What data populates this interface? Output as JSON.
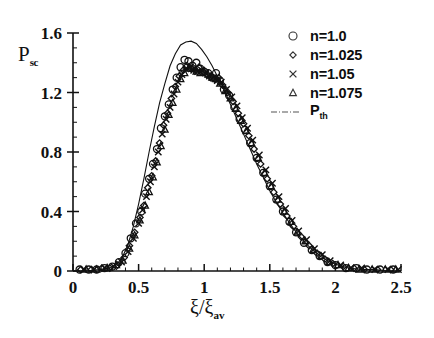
{
  "chart_data": {
    "type": "scatter",
    "title": "",
    "xlabel": "ξ/ξav",
    "xlabel_main": "ξ/ξ",
    "xlabel_sub": "av",
    "ylabel_main": "P",
    "ylabel_sub": "sc",
    "xlim": [
      0,
      2.5
    ],
    "ylim": [
      0,
      1.6
    ],
    "xticks": [
      0,
      0.5,
      1,
      1.5,
      2,
      2.5
    ],
    "xticklabels": [
      "0",
      "0.5",
      "1",
      "1.5",
      "2",
      "2.5"
    ],
    "yticks": [
      0,
      0.4,
      0.8,
      1.2,
      1.6
    ],
    "yticklabels": [
      "0",
      "0.4",
      "0.8",
      "1.2",
      "1.6"
    ],
    "minor_ticks": true,
    "grid": false,
    "legend_position": "top-right",
    "legend": [
      {
        "label": "n=1.0",
        "marker": "circle"
      },
      {
        "label": "n=1.025",
        "marker": "diamond"
      },
      {
        "label": "n=1.05",
        "marker": "cross"
      },
      {
        "label": "n=1.075",
        "marker": "triangle"
      },
      {
        "label": "Pth",
        "label_main": "P",
        "label_sub": "th",
        "marker": "dashdot-line"
      }
    ],
    "series": [
      {
        "name": "n=1.0",
        "marker": "circle",
        "x": [
          0.05,
          0.12,
          0.18,
          0.24,
          0.3,
          0.35,
          0.4,
          0.44,
          0.48,
          0.52,
          0.55,
          0.58,
          0.61,
          0.64,
          0.67,
          0.7,
          0.73,
          0.76,
          0.79,
          0.82,
          0.85,
          0.88,
          0.91,
          0.94,
          0.97,
          1.0,
          1.03,
          1.06,
          1.09,
          1.12,
          1.15,
          1.19,
          1.23,
          1.27,
          1.31,
          1.35,
          1.4,
          1.45,
          1.5,
          1.55,
          1.6,
          1.65,
          1.7,
          1.76,
          1.82,
          1.88,
          1.94,
          2.0,
          2.08,
          2.16,
          2.24,
          2.34,
          2.44
        ],
        "y": [
          0.01,
          0.01,
          0.01,
          0.02,
          0.03,
          0.06,
          0.12,
          0.22,
          0.32,
          0.4,
          0.52,
          0.62,
          0.72,
          0.82,
          0.96,
          1.04,
          1.12,
          1.22,
          1.3,
          1.37,
          1.42,
          1.41,
          1.38,
          1.4,
          1.36,
          1.34,
          1.33,
          1.3,
          1.33,
          1.28,
          1.22,
          1.18,
          1.1,
          1.02,
          0.95,
          0.86,
          0.76,
          0.66,
          0.57,
          0.48,
          0.4,
          0.33,
          0.26,
          0.19,
          0.14,
          0.1,
          0.06,
          0.04,
          0.02,
          0.02,
          0.01,
          0.01,
          0.01
        ]
      },
      {
        "name": "n=1.025",
        "marker": "diamond",
        "x": [
          0.06,
          0.14,
          0.22,
          0.28,
          0.34,
          0.39,
          0.43,
          0.47,
          0.51,
          0.54,
          0.57,
          0.6,
          0.63,
          0.66,
          0.69,
          0.72,
          0.75,
          0.78,
          0.81,
          0.84,
          0.87,
          0.9,
          0.93,
          0.96,
          0.99,
          1.02,
          1.05,
          1.08,
          1.11,
          1.14,
          1.18,
          1.22,
          1.26,
          1.3,
          1.34,
          1.38,
          1.43,
          1.48,
          1.53,
          1.58,
          1.63,
          1.68,
          1.74,
          1.8,
          1.86,
          1.92,
          1.98,
          2.06,
          2.14,
          2.22,
          2.32,
          2.42
        ],
        "y": [
          0.01,
          0.01,
          0.02,
          0.02,
          0.04,
          0.09,
          0.17,
          0.26,
          0.36,
          0.44,
          0.56,
          0.64,
          0.74,
          0.86,
          0.98,
          1.06,
          1.16,
          1.24,
          1.31,
          1.35,
          1.38,
          1.36,
          1.35,
          1.37,
          1.34,
          1.32,
          1.31,
          1.29,
          1.3,
          1.25,
          1.2,
          1.14,
          1.06,
          0.99,
          0.91,
          0.82,
          0.72,
          0.62,
          0.53,
          0.45,
          0.37,
          0.3,
          0.23,
          0.17,
          0.12,
          0.08,
          0.05,
          0.03,
          0.02,
          0.01,
          0.01,
          0.01
        ]
      },
      {
        "name": "n=1.05",
        "marker": "cross",
        "x": [
          0.08,
          0.16,
          0.24,
          0.31,
          0.37,
          0.42,
          0.46,
          0.5,
          0.53,
          0.56,
          0.59,
          0.62,
          0.65,
          0.68,
          0.71,
          0.74,
          0.77,
          0.8,
          0.83,
          0.86,
          0.89,
          0.92,
          0.95,
          0.98,
          1.01,
          1.04,
          1.07,
          1.1,
          1.13,
          1.17,
          1.21,
          1.25,
          1.29,
          1.33,
          1.37,
          1.42,
          1.47,
          1.52,
          1.57,
          1.62,
          1.67,
          1.72,
          1.78,
          1.84,
          1.9,
          1.96,
          2.04,
          2.12,
          2.2,
          2.3,
          2.4,
          2.48
        ],
        "y": [
          0.01,
          0.01,
          0.02,
          0.03,
          0.06,
          0.13,
          0.22,
          0.32,
          0.41,
          0.5,
          0.6,
          0.7,
          0.8,
          0.92,
          1.02,
          1.1,
          1.19,
          1.27,
          1.32,
          1.36,
          1.37,
          1.35,
          1.34,
          1.35,
          1.33,
          1.31,
          1.3,
          1.28,
          1.27,
          1.22,
          1.17,
          1.11,
          1.03,
          0.96,
          0.88,
          0.78,
          0.68,
          0.59,
          0.5,
          0.42,
          0.34,
          0.27,
          0.21,
          0.15,
          0.11,
          0.07,
          0.04,
          0.02,
          0.02,
          0.01,
          0.01,
          0.01
        ]
      },
      {
        "name": "n=1.075",
        "marker": "triangle",
        "x": [
          0.1,
          0.18,
          0.26,
          0.33,
          0.38,
          0.43,
          0.47,
          0.51,
          0.55,
          0.58,
          0.61,
          0.64,
          0.67,
          0.7,
          0.73,
          0.76,
          0.79,
          0.82,
          0.85,
          0.88,
          0.91,
          0.94,
          0.97,
          1.0,
          1.03,
          1.06,
          1.09,
          1.12,
          1.16,
          1.2,
          1.24,
          1.28,
          1.32,
          1.36,
          1.41,
          1.46,
          1.51,
          1.56,
          1.61,
          1.66,
          1.71,
          1.77,
          1.83,
          1.89,
          1.95,
          2.02,
          2.1,
          2.18,
          2.28,
          2.38,
          2.46
        ],
        "y": [
          0.01,
          0.01,
          0.02,
          0.04,
          0.07,
          0.15,
          0.24,
          0.34,
          0.44,
          0.53,
          0.63,
          0.73,
          0.84,
          0.95,
          1.05,
          1.13,
          1.22,
          1.29,
          1.33,
          1.36,
          1.36,
          1.34,
          1.33,
          1.34,
          1.32,
          1.3,
          1.29,
          1.26,
          1.21,
          1.16,
          1.09,
          1.01,
          0.94,
          0.86,
          0.76,
          0.66,
          0.57,
          0.48,
          0.4,
          0.33,
          0.26,
          0.2,
          0.14,
          0.1,
          0.06,
          0.04,
          0.02,
          0.01,
          0.01,
          0.01,
          0.01
        ]
      }
    ],
    "theory_curve": {
      "name": "Pth",
      "style": "solid-thin",
      "x": [
        0.0,
        0.1,
        0.2,
        0.28,
        0.34,
        0.38,
        0.42,
        0.46,
        0.5,
        0.54,
        0.58,
        0.62,
        0.66,
        0.7,
        0.74,
        0.78,
        0.82,
        0.86,
        0.9,
        0.94,
        0.98,
        1.02,
        1.06,
        1.1,
        1.14,
        1.18,
        1.22,
        1.26,
        1.3,
        1.35,
        1.4,
        1.45,
        1.5,
        1.55,
        1.6,
        1.66,
        1.72,
        1.78,
        1.84,
        1.9,
        1.96,
        2.02,
        2.1,
        2.2,
        2.3,
        2.4,
        2.5
      ],
      "y": [
        0.0,
        0.0,
        0.01,
        0.02,
        0.05,
        0.1,
        0.18,
        0.3,
        0.45,
        0.62,
        0.8,
        0.97,
        1.13,
        1.26,
        1.38,
        1.46,
        1.52,
        1.54,
        1.545,
        1.53,
        1.49,
        1.44,
        1.38,
        1.31,
        1.24,
        1.16,
        1.08,
        1.0,
        0.92,
        0.82,
        0.72,
        0.63,
        0.54,
        0.46,
        0.39,
        0.31,
        0.24,
        0.18,
        0.13,
        0.09,
        0.06,
        0.04,
        0.02,
        0.01,
        0.01,
        0.0,
        0.0
      ]
    }
  }
}
